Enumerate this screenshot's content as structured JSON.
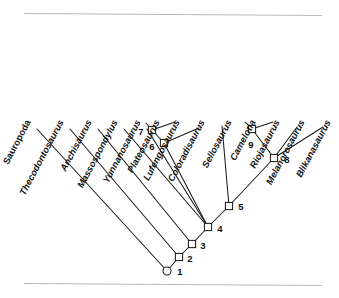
{
  "figure": {
    "type": "cladogram",
    "background_color": "#ffffff",
    "line_color": "#1a1a1a",
    "frame_color": "#b9b9b9"
  },
  "frame": {
    "top_rule_label": "top-rule",
    "bottom_rule_label": "bottom-rule"
  },
  "taxa": [
    {
      "id": "sauropoda",
      "label": "Sauropoda",
      "italic": false,
      "label_x": 31,
      "label_y": 122,
      "tip_x": 37,
      "tip_y": 129
    },
    {
      "id": "thecodontosaurus",
      "label": "Thecodontosaurus",
      "italic": true,
      "label_x": 64,
      "label_y": 122,
      "tip_x": 70,
      "tip_y": 129
    },
    {
      "id": "anchisaurus",
      "label": "Anchisaurus",
      "italic": true,
      "label_x": 92,
      "label_y": 122,
      "tip_x": 98,
      "tip_y": 129
    },
    {
      "id": "massospondylus",
      "label": "Massospondylus",
      "italic": true,
      "label_x": 118,
      "label_y": 122,
      "tip_x": 124,
      "tip_y": 129
    },
    {
      "id": "yunnanosaurus",
      "label": "Yunnanosaurus",
      "italic": true,
      "label_x": 141,
      "label_y": 122,
      "tip_x": 147,
      "tip_y": 129
    },
    {
      "id": "plateosaurus",
      "label": "Plateosaurus",
      "italic": true,
      "label_x": 160,
      "label_y": 122,
      "tip_x": 146,
      "tip_y": 123
    },
    {
      "id": "lufengosaurus",
      "label": "Lufengosaurus",
      "italic": true,
      "label_x": 180,
      "label_y": 122,
      "tip_x": 175,
      "tip_y": 122
    },
    {
      "id": "coloradisaurus",
      "label": "Coloradisaurus",
      "italic": true,
      "label_x": 205,
      "label_y": 122,
      "tip_x": 199,
      "tip_y": 128
    },
    {
      "id": "sellosaurus",
      "label": "Sellosaurus",
      "italic": true,
      "label_x": 232,
      "label_y": 122,
      "tip_x": 222,
      "tip_y": 126
    },
    {
      "id": "camelotia",
      "label": "Camelotia",
      "italic": true,
      "label_x": 256,
      "label_y": 122,
      "tip_x": 245,
      "tip_y": 122
    },
    {
      "id": "riojasaurus",
      "label": "Riojasaurus",
      "italic": true,
      "label_x": 280,
      "label_y": 122,
      "tip_x": 273,
      "tip_y": 122
    },
    {
      "id": "melanorosaurus",
      "label": "Melanorosaurus",
      "italic": true,
      "label_x": 305,
      "label_y": 122,
      "tip_x": 297,
      "tip_y": 127
    },
    {
      "id": "blikanasaurus",
      "label": "Blikanasaurus",
      "italic": true,
      "label_x": 331,
      "label_y": 122,
      "tip_x": 323,
      "tip_y": 127
    }
  ],
  "nodes": [
    {
      "id": "node-1",
      "number": "1",
      "shape": "circle",
      "x": 167,
      "y": 271,
      "label_x": 180,
      "label_y": 272
    },
    {
      "id": "node-2",
      "number": "2",
      "shape": "square",
      "x": 179,
      "y": 257,
      "label_x": 190,
      "label_y": 259
    },
    {
      "id": "node-3",
      "number": "3",
      "shape": "square",
      "x": 192,
      "y": 244,
      "label_x": 203,
      "label_y": 246
    },
    {
      "id": "node-4",
      "number": "4",
      "shape": "square",
      "x": 208,
      "y": 227,
      "label_x": 220,
      "label_y": 229
    },
    {
      "id": "node-5",
      "number": "5",
      "shape": "square",
      "x": 229,
      "y": 206,
      "label_x": 241,
      "label_y": 207
    },
    {
      "id": "node-6",
      "number": "6",
      "shape": "square",
      "x": 164,
      "y": 143,
      "label_x": 152,
      "label_y": 147
    },
    {
      "id": "node-7",
      "number": "7",
      "shape": "square",
      "x": 152,
      "y": 130,
      "label_x": 141,
      "label_y": 132
    },
    {
      "id": "node-8",
      "number": "8",
      "shape": "square",
      "x": 274,
      "y": 158,
      "label_x": 287,
      "label_y": 160
    },
    {
      "id": "node-9",
      "number": "9",
      "shape": "square",
      "x": 252,
      "y": 129,
      "label_x": 251,
      "label_y": 145
    }
  ],
  "edges": [
    {
      "id": "edge-node1-sauropoda",
      "x1": 167,
      "y1": 271,
      "x2": 37,
      "y2": 129
    },
    {
      "id": "edge-node1-node2",
      "x1": 167,
      "y1": 271,
      "x2": 179,
      "y2": 257
    },
    {
      "id": "edge-node2-thecodontosaurus",
      "x1": 179,
      "y1": 257,
      "x2": 70,
      "y2": 129
    },
    {
      "id": "edge-node2-node3",
      "x1": 179,
      "y1": 257,
      "x2": 192,
      "y2": 244
    },
    {
      "id": "edge-node3-anchisaurus",
      "x1": 192,
      "y1": 244,
      "x2": 98,
      "y2": 129
    },
    {
      "id": "edge-node3-node4",
      "x1": 192,
      "y1": 244,
      "x2": 208,
      "y2": 227
    },
    {
      "id": "edge-node4-massospondylus",
      "x1": 208,
      "y1": 227,
      "x2": 124,
      "y2": 129
    },
    {
      "id": "edge-node4-yunnanosaurus",
      "x1": 208,
      "y1": 227,
      "x2": 147,
      "y2": 129
    },
    {
      "id": "edge-node4-node6",
      "x1": 208,
      "y1": 227,
      "x2": 164,
      "y2": 143
    },
    {
      "id": "edge-node4-node5",
      "x1": 208,
      "y1": 227,
      "x2": 229,
      "y2": 206
    },
    {
      "id": "edge-node6-node7",
      "x1": 164,
      "y1": 143,
      "x2": 152,
      "y2": 130
    },
    {
      "id": "edge-node6-coloradisaurus",
      "x1": 164,
      "y1": 143,
      "x2": 199,
      "y2": 128
    },
    {
      "id": "edge-node7-plateosaurus",
      "x1": 152,
      "y1": 130,
      "x2": 146,
      "y2": 123
    },
    {
      "id": "edge-node7-lufengosaurus",
      "x1": 152,
      "y1": 130,
      "x2": 175,
      "y2": 122
    },
    {
      "id": "edge-node5-sellosaurus",
      "x1": 229,
      "y1": 206,
      "x2": 222,
      "y2": 126
    },
    {
      "id": "edge-node5-node8",
      "x1": 229,
      "y1": 206,
      "x2": 274,
      "y2": 158
    },
    {
      "id": "edge-node8-node9",
      "x1": 274,
      "y1": 158,
      "x2": 252,
      "y2": 129
    },
    {
      "id": "edge-node8-melanorosaurus",
      "x1": 274,
      "y1": 158,
      "x2": 297,
      "y2": 127
    },
    {
      "id": "edge-node8-blikanasaurus",
      "x1": 274,
      "y1": 158,
      "x2": 323,
      "y2": 127
    },
    {
      "id": "edge-node9-camelotia",
      "x1": 252,
      "y1": 129,
      "x2": 245,
      "y2": 122
    },
    {
      "id": "edge-node9-riojasaurus",
      "x1": 252,
      "y1": 129,
      "x2": 273,
      "y2": 122
    }
  ],
  "chart_data": {
    "type": "tree",
    "terminal_taxa": [
      "Sauropoda",
      "Thecodontosaurus",
      "Anchisaurus",
      "Massospondylus",
      "Yunnanosaurus",
      "Plateosaurus",
      "Lufengosaurus",
      "Coloradisaurus",
      "Sellosaurus",
      "Camelotia",
      "Riojasaurus",
      "Melanorosaurus",
      "Blikanasaurus"
    ],
    "node_numbers": [
      "1",
      "2",
      "3",
      "4",
      "5",
      "6",
      "7",
      "8",
      "9"
    ],
    "topology": {
      "1": [
        "Sauropoda",
        "2"
      ],
      "2": [
        "Thecodontosaurus",
        "3"
      ],
      "3": [
        "Anchisaurus",
        "4"
      ],
      "4": [
        "Massospondylus",
        "Yunnanosaurus",
        "6",
        "5"
      ],
      "6": [
        "7",
        "Coloradisaurus"
      ],
      "7": [
        "Plateosaurus",
        "Lufengosaurus"
      ],
      "5": [
        "Sellosaurus",
        "8"
      ],
      "8": [
        "9",
        "Melanorosaurus",
        "Blikanasaurus"
      ],
      "9": [
        "Camelotia",
        "Riojasaurus"
      ]
    },
    "node_symbols": {
      "1": "circle",
      "2": "square",
      "3": "square",
      "4": "square",
      "5": "square",
      "6": "square",
      "7": "square",
      "8": "square",
      "9": "square"
    },
    "grid": false,
    "legend": "none"
  }
}
